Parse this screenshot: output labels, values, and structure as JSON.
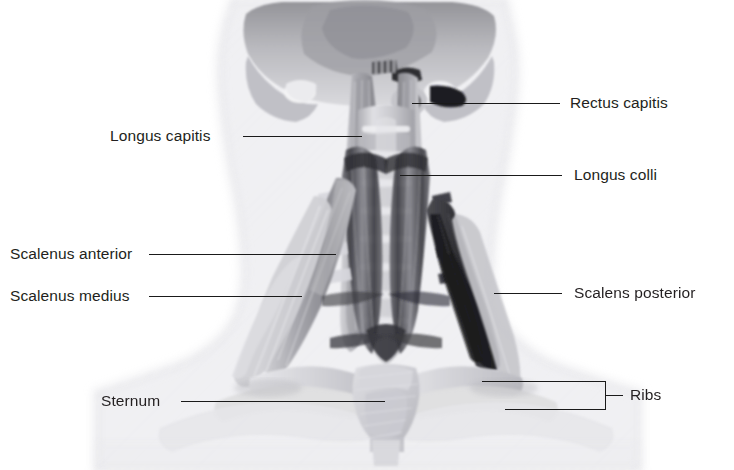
{
  "figure": {
    "view": "anterior view of the neck",
    "background_color": "#ffffff",
    "line_color": "#1a1a1a",
    "text_color": "#231f20",
    "top_cutoff_text": "",
    "labels": [
      {
        "id": "longus-capitis",
        "text": "Longus capitis",
        "side": "left",
        "text_x": 110,
        "text_y": 128,
        "leader_x1": 243,
        "leader_x2": 362,
        "leader_y": 136
      },
      {
        "id": "scalenus-anterior",
        "text": "Scalenus anterior",
        "side": "left",
        "text_x": 10,
        "text_y": 246,
        "leader_x1": 149,
        "leader_x2": 336,
        "leader_y": 254
      },
      {
        "id": "scalenus-medius",
        "text": "Scalenus medius",
        "side": "left",
        "text_x": 10,
        "text_y": 288,
        "leader_x1": 149,
        "leader_x2": 302,
        "leader_y": 296
      },
      {
        "id": "sternum",
        "text": "Sternum",
        "side": "left",
        "text_x": 101,
        "text_y": 393,
        "leader_x1": 181,
        "leader_x2": 385,
        "leader_y": 401
      },
      {
        "id": "rectus-capitis",
        "text": "Rectus capitis",
        "side": "right",
        "text_x": 570,
        "text_y": 95,
        "leader_x1": 412,
        "leader_x2": 560,
        "leader_y": 103
      },
      {
        "id": "longus-colli",
        "text": "Longus colli",
        "side": "right",
        "text_x": 574,
        "text_y": 167,
        "leader_x1": 400,
        "leader_x2": 562,
        "leader_y": 175
      },
      {
        "id": "scalens-posterior",
        "text": "Scalens posterior",
        "side": "right",
        "text_x": 574,
        "text_y": 285,
        "leader_x1": 494,
        "leader_x2": 562,
        "leader_y": 293
      }
    ],
    "bracket_label": {
      "id": "ribs",
      "text": "Ribs",
      "text_x": 630,
      "text_y": 384,
      "top_leader_x1": 482,
      "top_leader_x2": 605,
      "top_leader_y": 381,
      "bottom_leader_x1": 505,
      "bottom_leader_x2": 605,
      "bottom_leader_y": 409,
      "bar_x": 605,
      "bar_y1": 381,
      "bar_y2": 409,
      "tick_x1": 605,
      "tick_x2": 622,
      "tick_y": 395
    }
  }
}
